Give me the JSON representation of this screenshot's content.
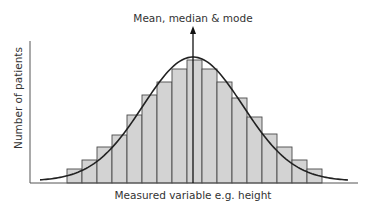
{
  "chart_data": {
    "type": "bar",
    "title": "Mean, median & mode",
    "xlabel": "Measured variable e.g. height",
    "ylabel": "Number of patients",
    "categories": [
      "1",
      "2",
      "3",
      "4",
      "5",
      "6",
      "7",
      "8",
      "9",
      "10",
      "11",
      "12",
      "13",
      "14",
      "15",
      "16",
      "17"
    ],
    "values": [
      14,
      23,
      36,
      48,
      68,
      88,
      101,
      114,
      123,
      114,
      101,
      85,
      66,
      49,
      36,
      23,
      14
    ],
    "overlay": "normal distribution curve",
    "annotation": {
      "text": "Mean, median & mode",
      "type": "vertical arrow at center bar"
    },
    "ticks": "none",
    "grid": false,
    "legend": "none"
  },
  "layout": {
    "axis_x": {
      "x0": 30,
      "x1": 358,
      "y": 183
    },
    "axis_y": {
      "x": 30,
      "y0": 41,
      "y1": 183
    },
    "bars_x0": 67,
    "bar_width": 15,
    "baseline": 183,
    "arrow": {
      "x": 193,
      "y_tip": 26,
      "y_base": 183
    },
    "curve": {
      "x_start": 40,
      "x_end": 348,
      "peak_x": 193,
      "peak_y": 57,
      "tail_y": 176
    }
  },
  "colors": {
    "bar_fill": "#d3d3d3",
    "bar_stroke": "#4a4a4a",
    "curve": "#222222",
    "axis": "#555555",
    "text": "#333333"
  }
}
